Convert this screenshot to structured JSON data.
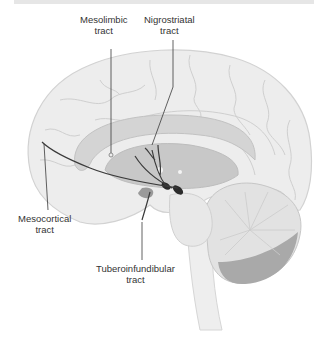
{
  "diagram": {
    "labels": [
      {
        "id": "mesolimbic",
        "line1": "Mesolimbic",
        "line2": "tract"
      },
      {
        "id": "nigrostriatal",
        "line1": "Nigrostriatal",
        "line2": "tract"
      },
      {
        "id": "mesocortical",
        "line1": "Mesocortical",
        "line2": "tract"
      },
      {
        "id": "tuberoinfundibular",
        "line1": "Tuberoinfundibular",
        "line2": "tract"
      }
    ],
    "colors": {
      "brain_fill": "#ededed",
      "brain_outline": "#d2d2d2",
      "gyri_lines": "#cfcfcf",
      "inner_structure": "#c8c8c8",
      "cerebellum_dark": "#a9a9a9",
      "tract_line": "#3a3a3a",
      "nuclei": "#2b2b2b",
      "label_text": "#333333"
    }
  }
}
